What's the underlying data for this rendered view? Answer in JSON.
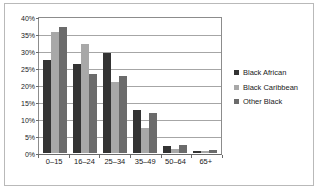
{
  "chart_data": {
    "type": "bar",
    "title": "",
    "subtitle": "",
    "xlabel": "",
    "ylabel": "",
    "categories": [
      "0–15",
      "16–24",
      "25–34",
      "35–49",
      "50–64",
      "65+"
    ],
    "series": [
      {
        "name": "Black African",
        "color": "#333333",
        "values": [
          27.8,
          26.6,
          29.9,
          12.8,
          2.0,
          0.6
        ]
      },
      {
        "name": "Black Caribbean",
        "color": "#a8a8a8",
        "values": [
          36.2,
          32.4,
          21.2,
          7.4,
          1.2,
          0.7
        ]
      },
      {
        "name": "Other Black",
        "color": "#6b6b6b",
        "values": [
          37.5,
          23.7,
          22.9,
          11.9,
          2.4,
          0.9
        ]
      }
    ],
    "ylim": [
      0,
      40
    ],
    "ytick_values": [
      0,
      5,
      10,
      15,
      20,
      25,
      30,
      35,
      40
    ],
    "ytick_labels": [
      "0%",
      "5%",
      "10%",
      "15%",
      "20%",
      "25%",
      "30%",
      "35%",
      "40%"
    ],
    "grid": true,
    "legend_position": "right",
    "colors": {
      "plot_border": "#8c8c8c",
      "gridline": "#a6a6a6",
      "figure_border": "#b9b9b9",
      "background": "#ffffff",
      "text": "#1a1a1a"
    }
  }
}
